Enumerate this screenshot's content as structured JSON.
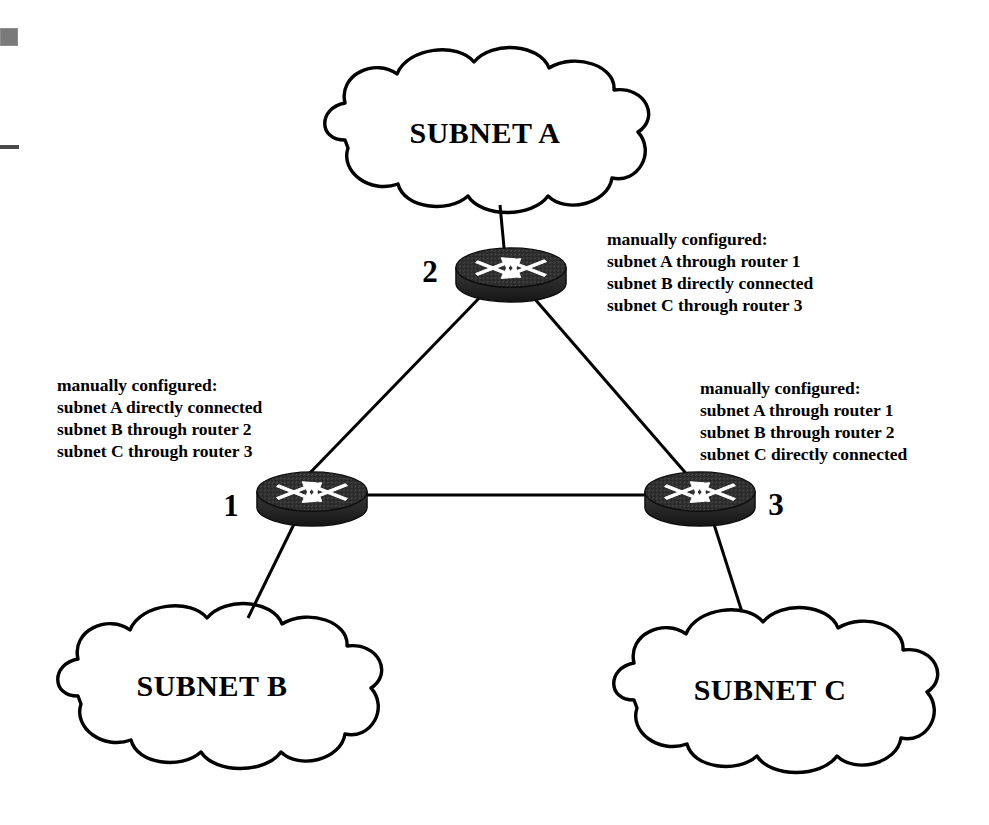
{
  "diagram": {
    "type": "network-topology",
    "background_color": "#ffffff",
    "line_color": "#000000",
    "router_color": "#2b2b2b"
  },
  "clouds": [
    {
      "id": "subnet-a",
      "label": "SUBNET A",
      "position": "top-center"
    },
    {
      "id": "subnet-b",
      "label": "SUBNET B",
      "position": "bottom-left"
    },
    {
      "id": "subnet-c",
      "label": "SUBNET C",
      "position": "bottom-right"
    }
  ],
  "routers": [
    {
      "id": "router-1",
      "number": "1",
      "label_side": "left",
      "icon": "router-icon"
    },
    {
      "id": "router-2",
      "number": "2",
      "label_side": "left",
      "icon": "router-icon"
    },
    {
      "id": "router-3",
      "number": "3",
      "label_side": "right",
      "icon": "router-icon"
    }
  ],
  "annotations": {
    "router_2": {
      "heading": "manually configured:",
      "lines": [
        "subnet A through router 1",
        "subnet B directly connected",
        "subnet C through router 3"
      ]
    },
    "router_1": {
      "heading": "manually configured:",
      "lines": [
        "subnet A directly connected",
        "subnet B through router 2",
        "subnet C through router 3"
      ]
    },
    "router_3": {
      "heading": "manually configured:",
      "lines": [
        "subnet A through router 1",
        "subnet B through router 2",
        "subnet C directly connected"
      ]
    }
  },
  "links": [
    {
      "from": "router-2",
      "to": "subnet-a",
      "style": "solid"
    },
    {
      "from": "router-1",
      "to": "subnet-b",
      "style": "solid"
    },
    {
      "from": "router-3",
      "to": "subnet-c",
      "style": "solid"
    },
    {
      "from": "router-1",
      "to": "router-2",
      "style": "solid"
    },
    {
      "from": "router-2",
      "to": "router-3",
      "style": "solid"
    },
    {
      "from": "router-1",
      "to": "router-3",
      "style": "solid"
    }
  ],
  "artifacts": [
    {
      "id": "scan-block",
      "kind": "gray-block"
    },
    {
      "id": "scan-line",
      "kind": "dark-line"
    }
  ]
}
